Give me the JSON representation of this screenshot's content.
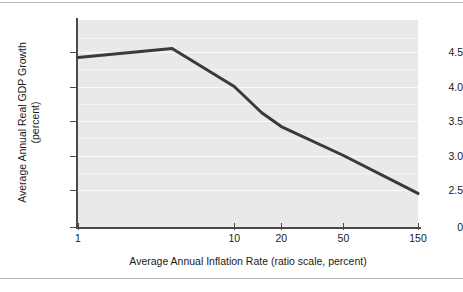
{
  "figure": {
    "background": "#ffffff",
    "plot_background": "#e9e9e9",
    "line_color": "#3a3a3a",
    "grid_color": "#fbfbfb",
    "axis_color": "#4a4a4a",
    "rule_color": "#b9b9b9"
  },
  "chart_data": {
    "type": "line",
    "title": "",
    "subtitle": "",
    "xlabel": "Average Annual Inflation Rate (ratio scale, percent)",
    "ylabel": "Average Annual Real GDP Growth (percent)",
    "ylabel_line1": "Average Annual Real GDP Growth",
    "ylabel_line2": "(percent)",
    "x_scale": "log",
    "y_scale": "linear",
    "xlim": [
      1,
      150
    ],
    "ylim": [
      2.3,
      4.75
    ],
    "xticks": [
      1,
      10,
      20,
      50,
      150
    ],
    "xtick_labels": [
      "1",
      "10",
      "20",
      "50",
      "150"
    ],
    "yticks": [
      2.5,
      3.0,
      3.5,
      4.0,
      4.5
    ],
    "ytick_labels": [
      "2.5",
      "3.0",
      "3.5",
      "4.0",
      "4.5"
    ],
    "y_origin_label": "0",
    "y_axis_break": true,
    "grid": true,
    "grid_axis": "y",
    "legend": "none",
    "series": [
      {
        "name": "Real GDP growth vs inflation",
        "x": [
          1,
          4,
          10,
          15,
          20,
          50,
          150
        ],
        "y": [
          4.42,
          4.55,
          4.0,
          3.62,
          3.42,
          3.0,
          2.45
        ]
      }
    ],
    "annotations": []
  },
  "axis": {
    "y_ticks": [
      {
        "label": "4.5",
        "value": 4.5
      },
      {
        "label": "4.0",
        "value": 4.0
      },
      {
        "label": "3.5",
        "value": 3.5
      },
      {
        "label": "3.0",
        "value": 3.0
      },
      {
        "label": "2.5",
        "value": 2.5
      },
      {
        "label": "0",
        "value": 0
      }
    ],
    "x_ticks": [
      {
        "label": "1",
        "value": 1
      },
      {
        "label": "10",
        "value": 10
      },
      {
        "label": "20",
        "value": 20
      },
      {
        "label": "50",
        "value": 50
      },
      {
        "label": "150",
        "value": 150
      }
    ]
  }
}
